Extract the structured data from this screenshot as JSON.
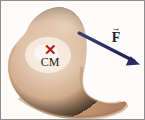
{
  "figure": {
    "name": "rigid-body-center-of-mass-force-diagram",
    "background_color": "#fdfcfa",
    "border_color": "#8e8e8e",
    "width": 145,
    "height": 120
  },
  "body": {
    "name": "irregular-rigid-body-blob",
    "fill_color": "#d2ab8d",
    "highlight_color": "#f6ece2",
    "shadow_color": "#a67c5b",
    "edge_color": "#b08968"
  },
  "center_of_mass": {
    "marker_glyph": "✕",
    "marker_color": "#b01a18",
    "label": "CM",
    "label_color": "#1a1a1a",
    "x": 49,
    "y": 49
  },
  "force_vector": {
    "label": "F",
    "vector_bar": "→",
    "color": "#2a2a63",
    "tail_x": 78,
    "tail_y": 32,
    "head_x": 138,
    "head_y": 63
  }
}
